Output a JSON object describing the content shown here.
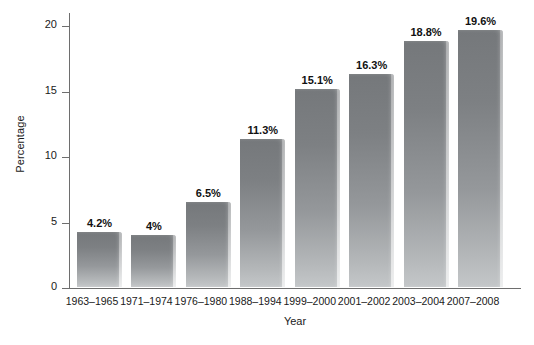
{
  "chart_data": {
    "type": "bar",
    "title": "",
    "xlabel": "Year",
    "ylabel": "Percentage",
    "categories": [
      "1963–1965",
      "1971–1974",
      "1976–1980",
      "1988–1994",
      "1999–2000",
      "2001–2002",
      "2003–2004",
      "2007–2008"
    ],
    "values": [
      4.2,
      4,
      6.5,
      11.3,
      15.1,
      16.3,
      18.8,
      19.6
    ],
    "data_labels": [
      "4.2%",
      "4%",
      "6.5%",
      "11.3%",
      "15.1%",
      "16.3%",
      "18.8%",
      "19.6%"
    ],
    "ylim": [
      0,
      21
    ],
    "yticks": [
      0,
      5,
      10,
      15,
      20
    ],
    "ytick_labels": [
      "0",
      "5",
      "10",
      "15",
      "20"
    ],
    "grid": false,
    "legend": null,
    "bar_color": "#85888b",
    "axis_color": "#6e6e6e",
    "background_color": "#ffffff",
    "text_color": "#1a1a1a"
  }
}
